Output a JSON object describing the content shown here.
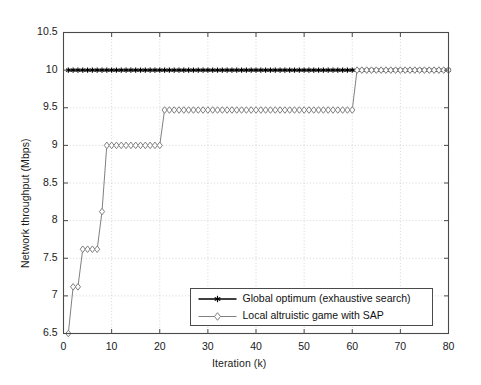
{
  "chart_data": {
    "type": "line",
    "title": "",
    "xlabel": "Iteration (k)",
    "ylabel": "Network throughput (Mbps)",
    "xlim": [
      0,
      80
    ],
    "ylim": [
      6.5,
      10.5
    ],
    "xticks": [
      0,
      10,
      20,
      30,
      40,
      50,
      60,
      70,
      80
    ],
    "yticks": [
      6.5,
      7,
      7.5,
      8,
      8.5,
      9,
      9.5,
      10,
      10.5
    ],
    "xtick_labels": [
      "0",
      "10",
      "20",
      "30",
      "40",
      "50",
      "60",
      "70",
      "80"
    ],
    "ytick_labels": [
      "6.5",
      "7",
      "7.5",
      "8",
      "8.5",
      "9",
      "9.5",
      "10",
      "10.5"
    ],
    "grid": true,
    "grid_style": "dotted",
    "legend_position": "lower right",
    "series": [
      {
        "name": "Global optimum (exhaustive search)",
        "color": "#000000",
        "marker": "star",
        "x": [
          1,
          2,
          3,
          4,
          5,
          6,
          7,
          8,
          9,
          10,
          11,
          12,
          13,
          14,
          15,
          16,
          17,
          18,
          19,
          20,
          21,
          22,
          23,
          24,
          25,
          26,
          27,
          28,
          29,
          30,
          31,
          32,
          33,
          34,
          35,
          36,
          37,
          38,
          39,
          40,
          41,
          42,
          43,
          44,
          45,
          46,
          47,
          48,
          49,
          50,
          51,
          52,
          53,
          54,
          55,
          56,
          57,
          58,
          59,
          60,
          61,
          62,
          63,
          64,
          65,
          66,
          67,
          68,
          69,
          70,
          71,
          72,
          73,
          74,
          75,
          76,
          77,
          78,
          79,
          80
        ],
        "values": [
          10,
          10,
          10,
          10,
          10,
          10,
          10,
          10,
          10,
          10,
          10,
          10,
          10,
          10,
          10,
          10,
          10,
          10,
          10,
          10,
          10,
          10,
          10,
          10,
          10,
          10,
          10,
          10,
          10,
          10,
          10,
          10,
          10,
          10,
          10,
          10,
          10,
          10,
          10,
          10,
          10,
          10,
          10,
          10,
          10,
          10,
          10,
          10,
          10,
          10,
          10,
          10,
          10,
          10,
          10,
          10,
          10,
          10,
          10,
          10,
          10,
          10,
          10,
          10,
          10,
          10,
          10,
          10,
          10,
          10,
          10,
          10,
          10,
          10,
          10,
          10,
          10,
          10,
          10,
          10
        ]
      },
      {
        "name": "Local altruistic game with SAP",
        "color": "#808080",
        "marker": "diamond",
        "x": [
          1,
          2,
          3,
          4,
          5,
          6,
          7,
          8,
          9,
          10,
          11,
          12,
          13,
          14,
          15,
          16,
          17,
          18,
          19,
          20,
          21,
          22,
          23,
          24,
          25,
          26,
          27,
          28,
          29,
          30,
          31,
          32,
          33,
          34,
          35,
          36,
          37,
          38,
          39,
          40,
          41,
          42,
          43,
          44,
          45,
          46,
          47,
          48,
          49,
          50,
          51,
          52,
          53,
          54,
          55,
          56,
          57,
          58,
          59,
          60,
          61,
          62,
          63,
          64,
          65,
          66,
          67,
          68,
          69,
          70,
          71,
          72,
          73,
          74,
          75,
          76,
          77,
          78,
          79,
          80
        ],
        "values": [
          6.5,
          7.12,
          7.12,
          7.62,
          7.62,
          7.62,
          7.62,
          8.12,
          9.0,
          9.0,
          9.0,
          9.0,
          9.0,
          9.0,
          9.0,
          9.0,
          9.0,
          9.0,
          9.0,
          9.0,
          9.47,
          9.47,
          9.47,
          9.47,
          9.47,
          9.47,
          9.47,
          9.47,
          9.47,
          9.47,
          9.47,
          9.47,
          9.47,
          9.47,
          9.47,
          9.47,
          9.47,
          9.47,
          9.47,
          9.47,
          9.47,
          9.47,
          9.47,
          9.47,
          9.47,
          9.47,
          9.47,
          9.47,
          9.47,
          9.47,
          9.47,
          9.47,
          9.47,
          9.47,
          9.47,
          9.47,
          9.47,
          9.47,
          9.47,
          9.47,
          10.0,
          10.0,
          10.0,
          10.0,
          10.0,
          10.0,
          10.0,
          10.0,
          10.0,
          10.0,
          10.0,
          10.0,
          10.0,
          10.0,
          10.0,
          10.0,
          10.0,
          10.0,
          10.0,
          10.0
        ]
      }
    ],
    "legend_entries": [
      "Global optimum (exhaustive search)",
      "Local altruistic game with SAP"
    ]
  }
}
